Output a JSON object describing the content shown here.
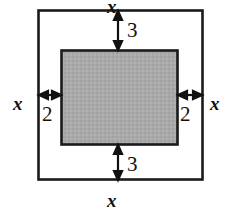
{
  "figure": {
    "background_color": "#ffffff",
    "outer_square": {
      "name": "outer-square",
      "stroke_color": "#1a1a1a",
      "fill_color": "#ffffff",
      "x": 38,
      "y": 10,
      "width": 165,
      "height": 170
    },
    "inner_rectangle": {
      "name": "inner-shaded-rectangle",
      "stroke_color": "#1a1a1a",
      "fill_color": "#a8a8a8",
      "x": 61,
      "y": 50,
      "width": 117,
      "height": 95
    },
    "labels": {
      "x_top": "x",
      "x_bottom": "x",
      "x_left": "x",
      "x_right": "x",
      "gap_top": "3",
      "gap_bottom": "3",
      "gap_left": "2",
      "gap_right": "2"
    },
    "dimensions": {
      "side_variable": "x",
      "top_gap": 3,
      "bottom_gap": 3,
      "left_gap": 2,
      "right_gap": 2
    }
  }
}
